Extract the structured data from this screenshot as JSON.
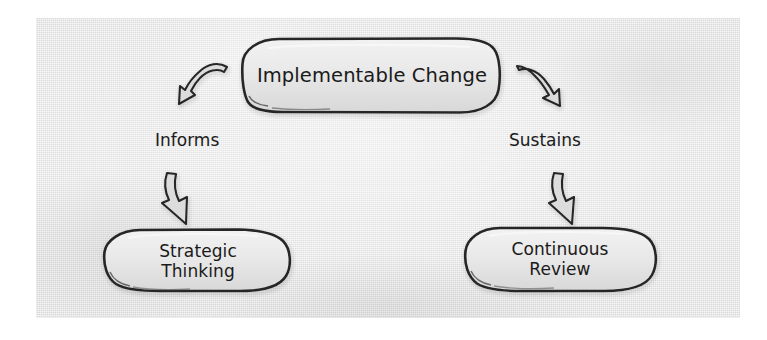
{
  "diagram": {
    "background_color": "#dedede",
    "ink_color": "#1a1a1a",
    "page_color": "#ffffff",
    "nodes": [
      {
        "id": "top",
        "label": "Implementable Change",
        "shape": "rounded-pill"
      },
      {
        "id": "bottom_left",
        "label_line1": "Strategic",
        "label_line2": "Thinking",
        "shape": "rounded-pill"
      },
      {
        "id": "bottom_right",
        "label_line1": "Continuous",
        "label_line2": "Review",
        "shape": "rounded-pill"
      }
    ],
    "edges": [
      {
        "id": "left",
        "label": "Informs",
        "from": "top",
        "to": "bottom_left",
        "arrow": "curved-down-left"
      },
      {
        "id": "right",
        "label": "Sustains",
        "from": "top",
        "to": "bottom_right",
        "arrow": "curved-down-right"
      },
      {
        "id": "left_down",
        "label": "",
        "from": "Informs",
        "to": "bottom_left",
        "arrow": "down"
      },
      {
        "id": "right_down",
        "label": "",
        "from": "Sustains",
        "to": "bottom_right",
        "arrow": "down"
      }
    ]
  }
}
